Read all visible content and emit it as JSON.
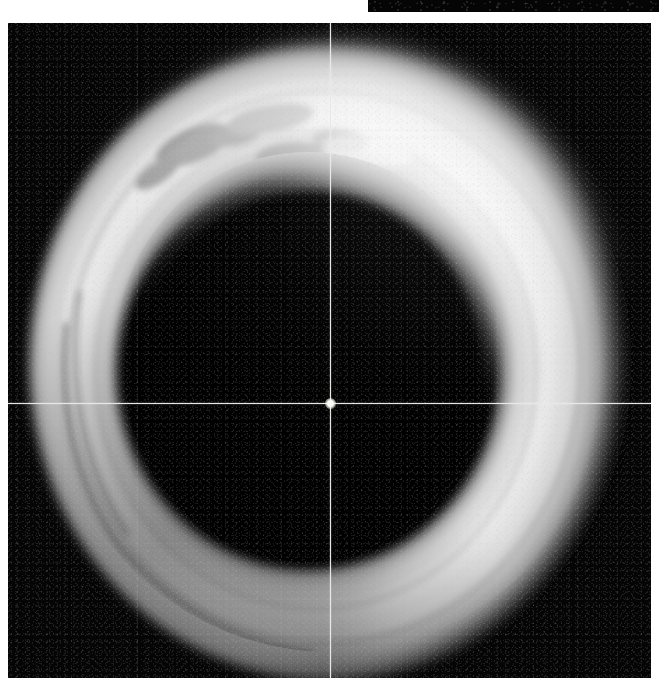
{
  "viewer": {
    "kind": "grayscale-cross-sectional-image",
    "modality_appearance": "monochrome medical / scientific sectional scan",
    "background_color": "#040404",
    "page_background_color": "#ffffff",
    "panel": {
      "x": 8,
      "y": 23,
      "width": 643,
      "height": 655
    }
  },
  "top_strip": {
    "name": "adjacent-panel-edge",
    "x": 368,
    "y": 0,
    "width": 291,
    "height": 14,
    "color": "#050505"
  },
  "reticle": {
    "label": "crosshair",
    "center_x": 330,
    "center_y": 403,
    "panel_center_x": 322,
    "panel_center_y": 380,
    "color": "#e8e8e0",
    "vertical_visible": true,
    "horizontal_visible": true,
    "center_dot_visible": true
  },
  "structure": {
    "name": "ring",
    "shape": "annulus / torus cross-section",
    "outer_cx": 322,
    "outer_cy": 340,
    "outer_rx": 292,
    "outer_ry": 312,
    "inner_cx": 300,
    "inner_cy": 350,
    "inner_rx": 192,
    "inner_ry": 198,
    "wall_brightness_peak": "#f4f4f4",
    "wall_brightness_low": "#9a9a9a",
    "lumen_color": "#060606"
  },
  "chart_data": {
    "type": "heatmap",
    "title": "",
    "xlabel": "",
    "ylabel": "",
    "colormap": "grayscale",
    "value_range": [
      0,
      255
    ],
    "annotations": [
      {
        "name": "crosshair-vertical",
        "x": 330
      },
      {
        "name": "crosshair-horizontal",
        "y": 403
      },
      {
        "name": "crosshair-center",
        "x": 330,
        "y": 403
      }
    ]
  }
}
